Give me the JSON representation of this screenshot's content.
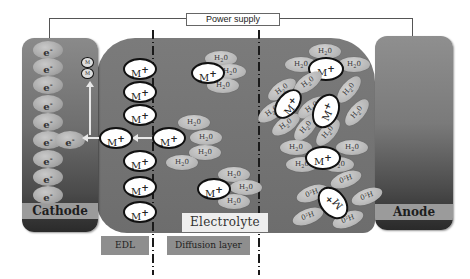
{
  "diagram": {
    "power_supply_label": "Power supply",
    "cathode_label": "Cathode",
    "anode_label": "Anode",
    "electrolyte_label": "Electrolyte",
    "edl_label": "EDL",
    "diffusion_label": "Diffusion layer",
    "electron_symbol": "e",
    "electron_charge": "-",
    "ion_symbol": "M",
    "ion_charge": "+",
    "deposited_symbol": "M",
    "water_symbol": "H",
    "water_sub": "2",
    "water_tail": "0",
    "water_flipped": "0²H"
  },
  "colors": {
    "electrode_top": "#8a8a8a",
    "electrode_bottom": "#2a2a2a",
    "electrolyte": "#747474",
    "label_band": "#9b9b9b",
    "ion_fill": "#ffffff",
    "water_fill": "#b8b8b8"
  }
}
